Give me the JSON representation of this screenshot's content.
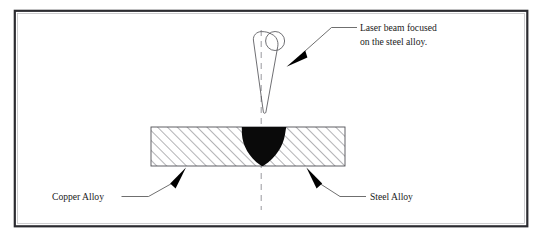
{
  "figure": {
    "background_color": "#ffffff",
    "frame": {
      "stroke_color": "#2b2b30",
      "x": 14,
      "y": 10,
      "width": 514,
      "height": 217
    }
  },
  "annotations": {
    "laser_note_line1": "Laser beam focused",
    "laser_note_line2": "on the steel alloy.",
    "copper_label": "Copper Alloy",
    "steel_label": "Steel Alloy"
  },
  "parts": {
    "laser_beam": {
      "name": "laser beam cone",
      "outline_color": "#55555a",
      "apex_y": 113
    },
    "centerline": {
      "name": "beam axis centerline",
      "style": "dashed",
      "color": "#8d8d93",
      "x": 261,
      "y_top": 30,
      "y_bottom": 210
    },
    "plate": {
      "name": "hatched workpiece plate",
      "hatch_color": "#6e6e73",
      "edge_color": "#4f4f54",
      "left": 151,
      "right": 345,
      "top": 127,
      "bottom": 166
    },
    "weld_pool": {
      "name": "molten weld pool",
      "fill_color": "#0a0a0a",
      "top_left_x": 242,
      "top_right_x": 286,
      "tip_y": 166
    }
  }
}
